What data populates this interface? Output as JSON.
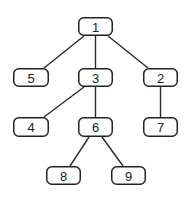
{
  "diagram": {
    "type": "tree",
    "root": "1",
    "colors": {
      "stroke": "#222222",
      "fill": "#ffffff",
      "text": "#222222"
    },
    "nodes": [
      {
        "id": "1",
        "label": "1",
        "x": 78,
        "y": 17,
        "w": 35,
        "h": 19
      },
      {
        "id": "5",
        "label": "5",
        "x": 13,
        "y": 68,
        "w": 36,
        "h": 19
      },
      {
        "id": "3",
        "label": "3",
        "x": 78,
        "y": 68,
        "w": 35,
        "h": 19
      },
      {
        "id": "2",
        "label": "2",
        "x": 143,
        "y": 68,
        "w": 35,
        "h": 19
      },
      {
        "id": "4",
        "label": "4",
        "x": 13,
        "y": 117,
        "w": 36,
        "h": 20
      },
      {
        "id": "6",
        "label": "6",
        "x": 78,
        "y": 117,
        "w": 35,
        "h": 20
      },
      {
        "id": "7",
        "label": "7",
        "x": 143,
        "y": 117,
        "w": 35,
        "h": 20
      },
      {
        "id": "8",
        "label": "8",
        "x": 46,
        "y": 166,
        "w": 35,
        "h": 19
      },
      {
        "id": "9",
        "label": "9",
        "x": 111,
        "y": 166,
        "w": 35,
        "h": 19
      }
    ],
    "edges": [
      {
        "from": "1",
        "to": "5",
        "x1": 84,
        "y1": 36,
        "x2": 44,
        "y2": 68
      },
      {
        "from": "1",
        "to": "3",
        "x1": 95.5,
        "y1": 36,
        "x2": 95.5,
        "y2": 68
      },
      {
        "from": "1",
        "to": "2",
        "x1": 108,
        "y1": 36,
        "x2": 148,
        "y2": 68
      },
      {
        "from": "3",
        "to": "4",
        "x1": 84,
        "y1": 87,
        "x2": 44,
        "y2": 117
      },
      {
        "from": "3",
        "to": "6",
        "x1": 95.5,
        "y1": 87,
        "x2": 95.5,
        "y2": 117
      },
      {
        "from": "2",
        "to": "7",
        "x1": 160.5,
        "y1": 87,
        "x2": 160.5,
        "y2": 117
      },
      {
        "from": "6",
        "to": "8",
        "x1": 89,
        "y1": 137,
        "x2": 70,
        "y2": 166
      },
      {
        "from": "6",
        "to": "9",
        "x1": 102,
        "y1": 137,
        "x2": 123,
        "y2": 166
      }
    ]
  }
}
